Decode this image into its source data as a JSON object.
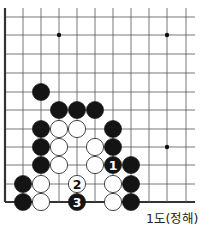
{
  "diagram": {
    "caption": "1도(정해)",
    "board": {
      "columns_x": [
        5,
        23,
        41,
        59,
        77,
        95,
        113,
        131,
        149,
        167,
        186
      ],
      "rows_y": [
        17,
        35,
        54,
        73,
        92,
        110,
        129,
        147,
        165,
        184,
        202
      ],
      "left_edge": true,
      "bottom_edge": true,
      "line_color": "#555555",
      "edge_color": "#333333",
      "star_points": [
        [
          3,
          1
        ],
        [
          9,
          1
        ],
        [
          9,
          7
        ]
      ]
    },
    "stones": [
      {
        "color": "black",
        "col": 2,
        "row": 4,
        "label": ""
      },
      {
        "color": "black",
        "col": 3,
        "row": 5,
        "label": ""
      },
      {
        "color": "black",
        "col": 4,
        "row": 5,
        "label": ""
      },
      {
        "color": "black",
        "col": 5,
        "row": 5,
        "label": ""
      },
      {
        "color": "black",
        "col": 2,
        "row": 6,
        "label": ""
      },
      {
        "color": "white",
        "col": 3,
        "row": 6,
        "label": ""
      },
      {
        "color": "white",
        "col": 4,
        "row": 6,
        "label": ""
      },
      {
        "color": "black",
        "col": 6,
        "row": 6,
        "label": ""
      },
      {
        "color": "black",
        "col": 2,
        "row": 7,
        "label": ""
      },
      {
        "color": "white",
        "col": 3,
        "row": 7,
        "label": ""
      },
      {
        "color": "white",
        "col": 5,
        "row": 7,
        "label": ""
      },
      {
        "color": "black",
        "col": 6,
        "row": 7,
        "label": ""
      },
      {
        "color": "black",
        "col": 2,
        "row": 8,
        "label": ""
      },
      {
        "color": "white",
        "col": 3,
        "row": 8,
        "label": ""
      },
      {
        "color": "white",
        "col": 5,
        "row": 8,
        "label": ""
      },
      {
        "color": "black",
        "col": 6,
        "row": 8,
        "label": "1"
      },
      {
        "color": "black",
        "col": 7,
        "row": 8,
        "label": ""
      },
      {
        "color": "black",
        "col": 1,
        "row": 9,
        "label": ""
      },
      {
        "color": "white",
        "col": 2,
        "row": 9,
        "label": ""
      },
      {
        "color": "white",
        "col": 4,
        "row": 9,
        "label": "2"
      },
      {
        "color": "white",
        "col": 6,
        "row": 9,
        "label": ""
      },
      {
        "color": "black",
        "col": 7,
        "row": 9,
        "label": ""
      },
      {
        "color": "black",
        "col": 1,
        "row": 10,
        "label": ""
      },
      {
        "color": "white",
        "col": 2,
        "row": 10,
        "label": ""
      },
      {
        "color": "black",
        "col": 4,
        "row": 10,
        "label": "3"
      },
      {
        "color": "white",
        "col": 6,
        "row": 10,
        "label": ""
      },
      {
        "color": "black",
        "col": 7,
        "row": 10,
        "label": ""
      }
    ]
  }
}
